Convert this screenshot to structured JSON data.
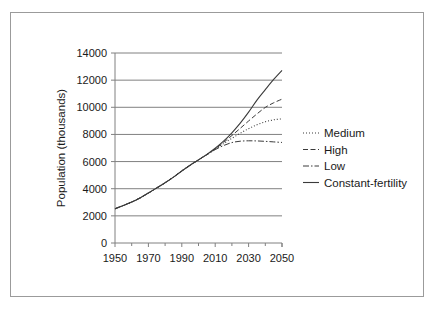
{
  "chart_data": {
    "type": "line",
    "title": "",
    "xlabel": "",
    "ylabel": "Population (thousands)",
    "xlim": [
      1950,
      2050
    ],
    "ylim": [
      0,
      14000
    ],
    "grid": true,
    "legend_position": "right",
    "x_ticks": [
      "1950",
      "1970",
      "1990",
      "2010",
      "2030",
      "2050"
    ],
    "x_tick_values": [
      1950,
      1970,
      1990,
      2010,
      2030,
      2050
    ],
    "x_minor_tick_values": [
      1960,
      1980,
      2000,
      2020,
      2040
    ],
    "y_ticks": [
      "0",
      "2000",
      "4000",
      "6000",
      "8000",
      "10000",
      "12000",
      "14000"
    ],
    "y_tick_values": [
      0,
      2000,
      4000,
      6000,
      8000,
      10000,
      12000,
      14000
    ],
    "x": [
      1950,
      1955,
      1960,
      1965,
      1970,
      1975,
      1980,
      1985,
      1990,
      1995,
      2000,
      2005,
      2010,
      2015,
      2020,
      2025,
      2030,
      2035,
      2040,
      2045,
      2050
    ],
    "series": [
      {
        "name": "Medium",
        "line_style": "dotted",
        "values": [
          2525,
          2758,
          3018,
          3322,
          3682,
          4061,
          4440,
          4853,
          5310,
          5735,
          6127,
          6514,
          6916,
          7325,
          7717,
          8083,
          8425,
          8710,
          8930,
          9075,
          9150
        ]
      },
      {
        "name": "High",
        "line_style": "dashed",
        "values": [
          2525,
          2758,
          3018,
          3322,
          3682,
          4061,
          4440,
          4853,
          5310,
          5735,
          6127,
          6514,
          6930,
          7410,
          7920,
          8450,
          8990,
          9510,
          9990,
          10330,
          10600
        ]
      },
      {
        "name": "Low",
        "line_style": "dashdot",
        "values": [
          2525,
          2758,
          3018,
          3322,
          3682,
          4061,
          4440,
          4853,
          5310,
          5735,
          6127,
          6500,
          6880,
          7180,
          7400,
          7500,
          7530,
          7520,
          7490,
          7450,
          7410
        ]
      },
      {
        "name": "Constant-fertility",
        "line_style": "solid",
        "values": [
          2525,
          2758,
          3018,
          3322,
          3682,
          4061,
          4440,
          4853,
          5310,
          5735,
          6127,
          6530,
          6980,
          7500,
          8120,
          8830,
          9640,
          10530,
          11300,
          12050,
          12720
        ]
      }
    ]
  },
  "legend": {
    "items": [
      {
        "label": "Medium"
      },
      {
        "label": "High"
      },
      {
        "label": "Low"
      },
      {
        "label": "Constant-fertility"
      }
    ]
  }
}
